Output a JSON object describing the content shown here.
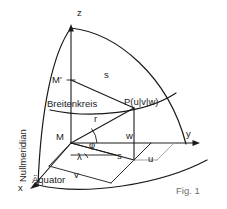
{
  "figure": {
    "caption": "Fig. 1",
    "axes": {
      "z": "z",
      "y": "y",
      "x": "x"
    },
    "points": {
      "center": "M",
      "pole_center": "M'",
      "surface_point": "P(u|v|w)"
    },
    "segments": {
      "radius": "r",
      "latitude_radius_upper": "s",
      "latitude_radius_lower": "s",
      "height": "w",
      "y_component": "v",
      "x_component": "u"
    },
    "angles": {
      "latitude": "φ",
      "longitude": "λ"
    },
    "curves": {
      "prime_meridian": "Nullmeridian",
      "latitude_circle": "Breitenkreis",
      "equator": "Äquator"
    },
    "colors": {
      "ink": "#1a1a1a",
      "caption": "#6e6e6e",
      "accent_grey": "#9a9a9a",
      "background": "#ffffff"
    }
  }
}
